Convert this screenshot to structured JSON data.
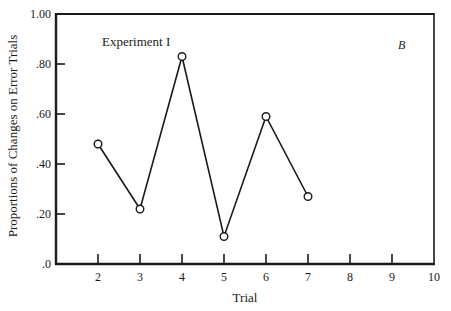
{
  "chart_data": {
    "type": "line",
    "title": "",
    "annotation": "Experiment I",
    "panel_label": "B",
    "xlabel": "Trial",
    "ylabel": "Proportions of Changes on Error Trials",
    "xlim": [
      1,
      10
    ],
    "ylim": [
      0,
      1.0
    ],
    "x_ticks": [
      2,
      3,
      4,
      5,
      6,
      7,
      8,
      9,
      10
    ],
    "x_tick_labels": [
      "2",
      "3",
      "4",
      "5",
      "6",
      "7",
      "8",
      "9",
      "10"
    ],
    "y_ticks": [
      0,
      0.2,
      0.4,
      0.6,
      0.8,
      1.0
    ],
    "y_tick_labels": [
      ".0",
      ".20",
      ".40",
      ".60",
      ".80",
      "1.00"
    ],
    "grid": false,
    "legend": null,
    "series": [
      {
        "name": "Experiment I",
        "marker": "open-circle",
        "x": [
          2,
          3,
          4,
          5,
          6,
          7
        ],
        "values": [
          0.48,
          0.22,
          0.83,
          0.11,
          0.59,
          0.27
        ]
      }
    ]
  },
  "colors": {
    "ink": "#1a1a1a",
    "background": "#ffffff"
  }
}
